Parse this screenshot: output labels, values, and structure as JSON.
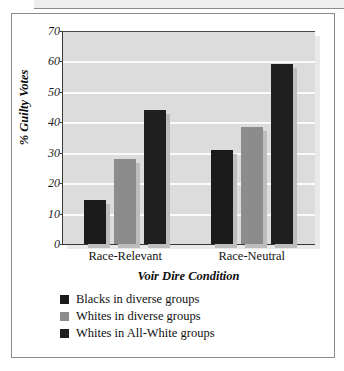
{
  "figure": {
    "background_color": "#ffffff",
    "frame_color": "#8b8b8b",
    "plot_background_color": "#dcdcdc",
    "gridline_color": "#fbfbfb"
  },
  "chart_data": {
    "type": "bar",
    "title": "",
    "subtitle": "",
    "xlabel": "Voir Dire Condition",
    "ylabel": "% Guilty Votes",
    "categories": [
      "Race-Relevant",
      "Race-Neutral"
    ],
    "series": [
      {
        "name": "Blacks in diverse groups",
        "color": "#1b1b1b",
        "values": [
          14.5,
          31
        ]
      },
      {
        "name": "Whites in diverse groups",
        "color": "#8c8c8c",
        "values": [
          28,
          38.5
        ]
      },
      {
        "name": "Whites in All-White groups",
        "color": "#1f1f1f",
        "values": [
          44,
          59
        ]
      }
    ],
    "ylim": [
      0,
      70
    ],
    "yticks": [
      0,
      10,
      20,
      30,
      40,
      50,
      60,
      70
    ],
    "ytick_labels": [
      "0",
      "10",
      "20",
      "30",
      "40",
      "50",
      "60",
      "70"
    ],
    "grid": true,
    "grid_axis": "y",
    "legend_position": "below-axis-left",
    "legend_entries": [
      "Blacks in diverse groups",
      "Whites in diverse groups",
      "Whites in All-White groups"
    ]
  }
}
